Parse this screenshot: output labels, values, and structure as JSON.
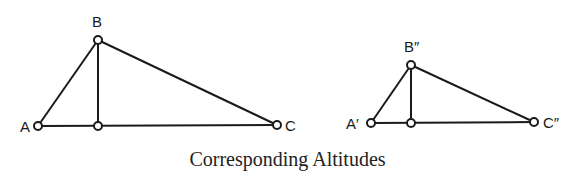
{
  "caption": "Corresponding Altitudes",
  "colors": {
    "stroke": "#1a1a1a",
    "background": "#ffffff"
  },
  "triangles": [
    {
      "name": "ABC",
      "vertices": {
        "A": {
          "label": "A",
          "x": 38,
          "y": 126
        },
        "B": {
          "label": "B",
          "x": 98,
          "y": 40
        },
        "C": {
          "label": "C",
          "x": 277,
          "y": 125
        }
      },
      "altitude_foot": {
        "x": 98,
        "y": 126
      }
    },
    {
      "name": "A'B''C''",
      "vertices": {
        "A": {
          "label": "A′",
          "x": 371,
          "y": 123
        },
        "B": {
          "label": "B″",
          "x": 411,
          "y": 65
        },
        "C": {
          "label": "C″",
          "x": 534,
          "y": 122
        }
      },
      "altitude_foot": {
        "x": 411,
        "y": 123
      }
    }
  ]
}
